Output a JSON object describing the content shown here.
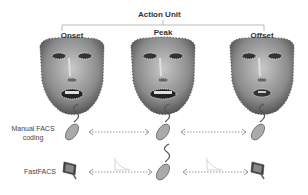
{
  "title": "Action Unit",
  "phases": [
    {
      "label": "Onset",
      "cx": 72
    },
    {
      "label": "Peak",
      "cx": 163
    },
    {
      "label": "Offset",
      "cx": 262
    }
  ],
  "rows": [
    {
      "label_line1": "Manual FACS",
      "label_line2": "coding",
      "icons": [
        "mouse-icon",
        "mouse-icon",
        "mouse-icon"
      ],
      "arrow": "dotted-double-arrow"
    },
    {
      "label_line1": "FastFACS",
      "label_line2": "",
      "icons": [
        "monitor-icon",
        "mouse-icon",
        "monitor-icon"
      ],
      "arrow": "dotted-double-arrow-with-curve-hint"
    }
  ],
  "colors": {
    "text": "#333333",
    "line": "#bbbbbb",
    "arrow": "#999999",
    "face_dark": "#555555",
    "face_light": "#bdbdbd",
    "landmark": "#ffffff"
  }
}
